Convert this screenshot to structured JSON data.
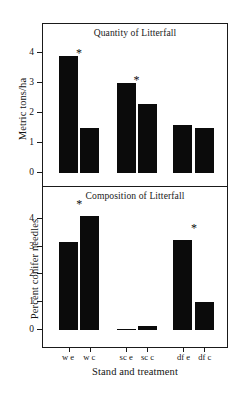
{
  "figure": {
    "xlabel": "Stand and treatment",
    "background": "#ffffff",
    "bar_color": "#0b0b0b",
    "axis_color": "#1a1a1a",
    "significance_marker": "*"
  },
  "chart_data": [
    {
      "type": "bar",
      "panel": "top",
      "title": "Quantity of Litterfall",
      "xlabel": "Stand and treatment",
      "ylabel": "Metric tons/ha",
      "categories": [
        "w e",
        "w c",
        "sc e",
        "sc c",
        "df e",
        "df c"
      ],
      "values": [
        3.9,
        1.5,
        3.0,
        2.3,
        1.6,
        1.5
      ],
      "significant": [
        true,
        false,
        true,
        false,
        false,
        false
      ],
      "ylim": [
        0,
        4.45
      ],
      "yticks": [
        0,
        1,
        2,
        3,
        4
      ],
      "yticklabels": [
        "0",
        "1",
        "2",
        "3",
        "4"
      ],
      "grid": false,
      "legend": "none"
    },
    {
      "type": "bar",
      "panel": "bottom",
      "title": "Composition of Litterfall",
      "xlabel": "Stand and treatment",
      "ylabel": "Percent conifer needles",
      "categories": [
        "w e",
        "w c",
        "sc e",
        "sc c",
        "df e",
        "df c"
      ],
      "values": [
        3.15,
        4.1,
        0.05,
        0.13,
        3.25,
        1.0
      ],
      "significant": [
        false,
        true,
        false,
        false,
        true,
        false
      ],
      "ylim": [
        0,
        4.6
      ],
      "yticks": [
        0,
        1,
        2,
        3,
        4
      ],
      "yticklabels": [
        "0",
        "1",
        "2",
        "3",
        "4"
      ],
      "grid": false,
      "legend": "none"
    }
  ]
}
